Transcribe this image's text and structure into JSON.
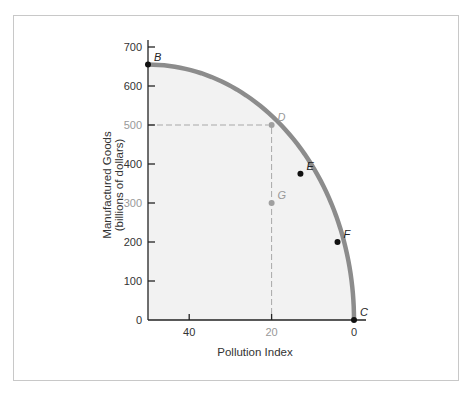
{
  "chart_data": {
    "type": "line",
    "title": "",
    "xlabel": "Pollution Index",
    "ylabel_line1": "Manufactured Goods",
    "ylabel_line2": "(billions of dollars)",
    "x_reversed": true,
    "xlim": [
      50,
      0
    ],
    "ylim": [
      0,
      700
    ],
    "x_ticks": [
      {
        "value": 40,
        "label": "40",
        "color": "#333333"
      },
      {
        "value": 20,
        "label": "20",
        "color": "#999999"
      },
      {
        "value": 0,
        "label": "0",
        "color": "#333333"
      }
    ],
    "y_ticks": [
      {
        "value": 0,
        "label": "0",
        "color": "#333333"
      },
      {
        "value": 100,
        "label": "100",
        "color": "#333333"
      },
      {
        "value": 200,
        "label": "200",
        "color": "#333333"
      },
      {
        "value": 300,
        "label": "300",
        "color": "#999999"
      },
      {
        "value": 400,
        "label": "400",
        "color": "#333333"
      },
      {
        "value": 500,
        "label": "500",
        "color": "#999999"
      },
      {
        "value": 600,
        "label": "600",
        "color": "#333333"
      },
      {
        "value": 700,
        "label": "700",
        "color": "#333333"
      }
    ],
    "grid": false,
    "series": [
      {
        "name": "Production possibilities frontier",
        "color": "#8c8c8c",
        "points": [
          {
            "label": "B",
            "x": 50,
            "y": 655,
            "color": "#111111"
          },
          {
            "label": "D",
            "x": 20,
            "y": 500,
            "color": "#a0a0a0"
          },
          {
            "label": "E",
            "x": 13,
            "y": 375,
            "color": "#111111"
          },
          {
            "label": "F",
            "x": 4,
            "y": 200,
            "color": "#111111"
          },
          {
            "label": "C",
            "x": 0,
            "y": 0,
            "color": "#111111"
          }
        ]
      }
    ],
    "interior_points": [
      {
        "label": "G",
        "x": 20,
        "y": 300,
        "color": "#a0a0a0"
      }
    ],
    "reference_lines": [
      {
        "type": "horizontal-dashed",
        "from_x": 50,
        "to_x": 20,
        "y": 500
      },
      {
        "type": "vertical-dashed",
        "x": 20,
        "from_y": 500,
        "to_y": 0
      }
    ],
    "fill_under_curve": "#f2f2f2",
    "legend": "none"
  }
}
